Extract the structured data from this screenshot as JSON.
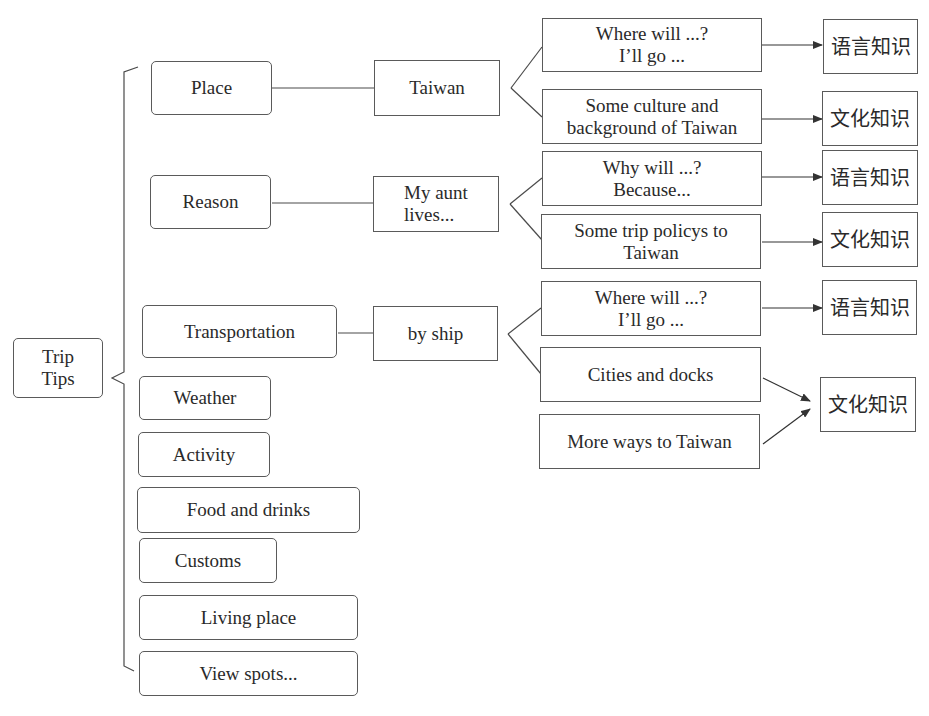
{
  "root": {
    "label": "Trip\nTips"
  },
  "categories": [
    {
      "id": "place",
      "label": "Place"
    },
    {
      "id": "reason",
      "label": "Reason"
    },
    {
      "id": "transportation",
      "label": "Transportation"
    },
    {
      "id": "weather",
      "label": "Weather"
    },
    {
      "id": "activity",
      "label": "Activity"
    },
    {
      "id": "food",
      "label": "Food and drinks"
    },
    {
      "id": "customs",
      "label": "Customs"
    },
    {
      "id": "living",
      "label": "Living place"
    },
    {
      "id": "views",
      "label": "View spots..."
    }
  ],
  "answers": [
    {
      "id": "taiwan",
      "label": "Taiwan"
    },
    {
      "id": "aunt",
      "label": "My aunt\nlives..."
    },
    {
      "id": "ship",
      "label": "by ship"
    }
  ],
  "details": [
    {
      "id": "d1",
      "label": "Where will ...?\nI’ll go ..."
    },
    {
      "id": "d2",
      "label": "Some culture and\nbackground of Taiwan"
    },
    {
      "id": "d3",
      "label": "Why will ...?\nBecause..."
    },
    {
      "id": "d4",
      "label": "Some trip policys to\nTaiwan"
    },
    {
      "id": "d5",
      "label": "Where will ...?\nI’ll go ..."
    },
    {
      "id": "d6",
      "label": "Cities and docks"
    },
    {
      "id": "d7",
      "label": "More ways to Taiwan"
    }
  ],
  "knowledge": [
    {
      "id": "k1",
      "label": "语言知识"
    },
    {
      "id": "k2",
      "label": "文化知识"
    },
    {
      "id": "k3",
      "label": "语言知识"
    },
    {
      "id": "k4",
      "label": "文化知识"
    },
    {
      "id": "k5",
      "label": "语言知识"
    },
    {
      "id": "k6",
      "label": "文化知识"
    }
  ],
  "colors": {
    "line": "#4a4a4a",
    "border": "#5a5a5a",
    "text": "#2a2a2a"
  }
}
